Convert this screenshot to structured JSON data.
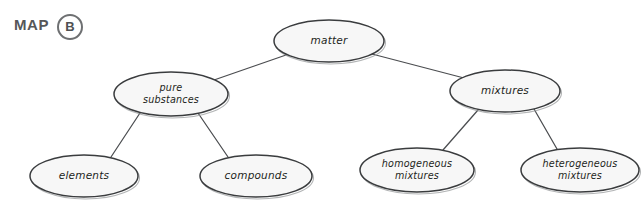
{
  "header": {
    "label": "MAP",
    "badge": "B"
  },
  "colors": {
    "background": "#ffffff",
    "node_fill": "#f7f7f7",
    "node_stroke": "#3a3c3e",
    "edge_stroke": "#4b4d50",
    "text": "#1d1f21",
    "badge_stroke": "#6e7072",
    "label_text": "#555759"
  },
  "diagram": {
    "type": "tree",
    "nodes": [
      {
        "id": "matter",
        "label": "matter",
        "lines": [
          "matter"
        ],
        "level": 0,
        "cx": 329,
        "cy": 41,
        "rx": 55,
        "ry": 21
      },
      {
        "id": "pure-substances",
        "label": "pure substances",
        "lines": [
          "pure",
          "substances"
        ],
        "level": 1,
        "cx": 171,
        "cy": 94,
        "rx": 57,
        "ry": 22
      },
      {
        "id": "mixtures",
        "label": "mixtures",
        "lines": [
          "mixtures"
        ],
        "level": 1,
        "cx": 505,
        "cy": 91,
        "rx": 55,
        "ry": 21
      },
      {
        "id": "elements",
        "label": "elements",
        "lines": [
          "elements"
        ],
        "level": 2,
        "cx": 84,
        "cy": 176,
        "rx": 54,
        "ry": 21
      },
      {
        "id": "compounds",
        "label": "compounds",
        "lines": [
          "compounds"
        ],
        "level": 2,
        "cx": 256,
        "cy": 176,
        "rx": 56,
        "ry": 21
      },
      {
        "id": "homogeneous-mixtures",
        "label": "homogeneous mixtures",
        "lines": [
          "homogeneous",
          "mixtures"
        ],
        "level": 2,
        "cx": 417,
        "cy": 170,
        "rx": 57,
        "ry": 22
      },
      {
        "id": "heterogeneous-mixtures",
        "label": "heterogeneous mixtures",
        "lines": [
          "heterogeneous",
          "mixtures"
        ],
        "level": 2,
        "cx": 580,
        "cy": 170,
        "rx": 59,
        "ry": 22
      }
    ],
    "edges": [
      {
        "from": "matter",
        "to": "pure-substances",
        "x1": 286,
        "y1": 55,
        "x2": 214,
        "y2": 80
      },
      {
        "from": "matter",
        "to": "mixtures",
        "x1": 372,
        "y1": 54,
        "x2": 464,
        "y2": 78
      },
      {
        "from": "pure-substances",
        "to": "elements",
        "x1": 140,
        "y1": 113,
        "x2": 111,
        "y2": 157
      },
      {
        "from": "pure-substances",
        "to": "compounds",
        "x1": 198,
        "y1": 113,
        "x2": 228,
        "y2": 157
      },
      {
        "from": "mixtures",
        "to": "homogeneous-mixtures",
        "x1": 478,
        "y1": 110,
        "x2": 443,
        "y2": 150
      },
      {
        "from": "mixtures",
        "to": "heterogeneous-mixtures",
        "x1": 534,
        "y1": 109,
        "x2": 557,
        "y2": 149
      }
    ]
  }
}
